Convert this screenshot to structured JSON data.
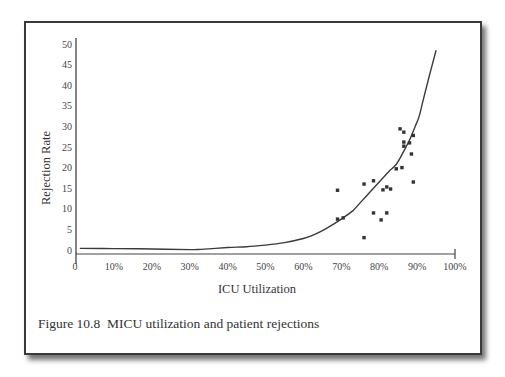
{
  "figure": {
    "caption": "Figure 10.8  MICU utilization and patient rejections"
  },
  "chart_data": {
    "type": "scatter",
    "title": "",
    "xlabel": "ICU Utilization",
    "ylabel": "Rejection Rate",
    "xlim": [
      0,
      100
    ],
    "ylim": [
      0,
      50
    ],
    "x_tick_labels": [
      "0",
      "10%",
      "20%",
      "30%",
      "40%",
      "50%",
      "60%",
      "70%",
      "80%",
      "90%",
      "100%"
    ],
    "y_tick_labels": [
      "0",
      "5",
      "10",
      "15",
      "20",
      "25",
      "30",
      "35",
      "40",
      "45",
      "50"
    ],
    "grid": false,
    "legend": null,
    "series": [
      {
        "name": "Observed rejections",
        "kind": "scatter",
        "marker": "square",
        "color": "#333333",
        "points": [
          {
            "x": 69,
            "y": 14.5
          },
          {
            "x": 69,
            "y": 7.5
          },
          {
            "x": 70.5,
            "y": 7.8
          },
          {
            "x": 76,
            "y": 16
          },
          {
            "x": 76,
            "y": 3
          },
          {
            "x": 78.5,
            "y": 16.8
          },
          {
            "x": 78.5,
            "y": 9
          },
          {
            "x": 80.5,
            "y": 7.3
          },
          {
            "x": 81,
            "y": 14.6
          },
          {
            "x": 82,
            "y": 9
          },
          {
            "x": 82,
            "y": 15.3
          },
          {
            "x": 83,
            "y": 14.8
          },
          {
            "x": 84.5,
            "y": 19.7
          },
          {
            "x": 85.5,
            "y": 29.4
          },
          {
            "x": 86,
            "y": 20
          },
          {
            "x": 86.5,
            "y": 28.6
          },
          {
            "x": 86.5,
            "y": 26.2
          },
          {
            "x": 86.5,
            "y": 25.2
          },
          {
            "x": 88,
            "y": 26
          },
          {
            "x": 88.5,
            "y": 23.3
          },
          {
            "x": 89,
            "y": 27.8
          },
          {
            "x": 89,
            "y": 16.5
          }
        ]
      },
      {
        "name": "Fitted curve",
        "kind": "line",
        "color": "#3a3a3a",
        "points": [
          {
            "x": 1,
            "y": 0.4
          },
          {
            "x": 10,
            "y": 0.35
          },
          {
            "x": 20,
            "y": 0.25
          },
          {
            "x": 30,
            "y": 0.1
          },
          {
            "x": 33,
            "y": 0.15
          },
          {
            "x": 40,
            "y": 0.6
          },
          {
            "x": 45,
            "y": 0.8
          },
          {
            "x": 50,
            "y": 1.2
          },
          {
            "x": 55,
            "y": 1.8
          },
          {
            "x": 60,
            "y": 2.8
          },
          {
            "x": 63,
            "y": 3.8
          },
          {
            "x": 66,
            "y": 5.2
          },
          {
            "x": 70,
            "y": 7.5
          },
          {
            "x": 73,
            "y": 9.5
          },
          {
            "x": 75,
            "y": 11.5
          },
          {
            "x": 78,
            "y": 14.5
          },
          {
            "x": 80,
            "y": 16.5
          },
          {
            "x": 82.5,
            "y": 19
          },
          {
            "x": 84.5,
            "y": 20.8
          },
          {
            "x": 86.5,
            "y": 24
          },
          {
            "x": 88,
            "y": 26.7
          },
          {
            "x": 89.5,
            "y": 30
          },
          {
            "x": 90.5,
            "y": 32.3
          },
          {
            "x": 91.5,
            "y": 36
          },
          {
            "x": 93,
            "y": 41.5
          },
          {
            "x": 95,
            "y": 48.5
          }
        ]
      }
    ]
  }
}
